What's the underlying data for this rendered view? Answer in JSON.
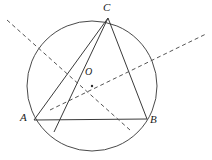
{
  "figure": {
    "type": "euclidean-geometry-diagram",
    "canvas": {
      "width": 212,
      "height": 160,
      "background": "#ffffff"
    },
    "colors": {
      "stroke": "#3a3a3a",
      "circle_stroke": "#4a4a4a",
      "dashed_stroke": "#555555",
      "label_color": "#1a1a1a",
      "background": "#ffffff"
    },
    "labels": {
      "A": "A",
      "B": "B",
      "C": "C",
      "O": "O"
    },
    "points": {
      "A": {
        "x": 34,
        "y": 120
      },
      "B": {
        "x": 147,
        "y": 119
      },
      "C": {
        "x": 108,
        "y": 18
      },
      "O": {
        "x": 92,
        "y": 86
      },
      "D": {
        "x": 54,
        "y": 132
      }
    },
    "circle": {
      "center_x": 92,
      "center_y": 86,
      "radius": 65,
      "stroke_width": 1
    },
    "solid_segments": [
      {
        "name": "side-AB",
        "from": "A",
        "to": "B"
      },
      {
        "name": "side-BC",
        "from": "B",
        "to": "C"
      },
      {
        "name": "side-CA",
        "from": "C",
        "to": "A"
      },
      {
        "name": "cevian-CD",
        "from": "C",
        "to": "D"
      }
    ],
    "dashed_lines": [
      {
        "name": "dashed-line-1",
        "x1": 7,
        "y1": 20,
        "x2": 130,
        "y2": 130
      },
      {
        "name": "dashed-line-2",
        "x1": 50,
        "y1": 110,
        "x2": 206,
        "y2": 34
      }
    ]
  }
}
